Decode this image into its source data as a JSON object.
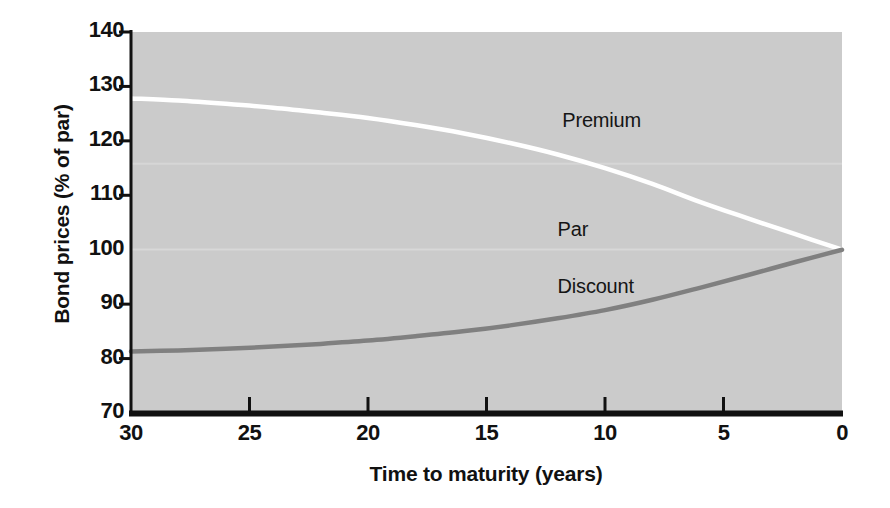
{
  "chart_data": {
    "type": "line",
    "title": "",
    "subtitle": "",
    "xlabel": "Time to maturity (years)",
    "ylabel": "Bond prices (% of par)",
    "xlim": [
      30,
      0
    ],
    "ylim": [
      70,
      140
    ],
    "x_ticks": [
      30,
      25,
      20,
      15,
      10,
      5,
      0
    ],
    "x_tick_labels": [
      "30",
      "25",
      "20",
      "15",
      "10",
      "5",
      "0"
    ],
    "y_ticks": [
      70,
      80,
      90,
      100,
      110,
      120,
      130,
      140
    ],
    "y_tick_labels": [
      "70",
      "80",
      "90",
      "100",
      "110",
      "120",
      "130",
      "140"
    ],
    "x_axis_reversed": true,
    "grid": false,
    "legend_position": "inline-annotations",
    "plot_background": "#cbcbcb",
    "figure_background": "#ffffff",
    "x": [
      30,
      28,
      26,
      24,
      22,
      20,
      18,
      16,
      14,
      12,
      10,
      8,
      6,
      4,
      2,
      0
    ],
    "series": [
      {
        "name": "Premium",
        "color": "#ffffff",
        "label": "Premium",
        "label_x": 11.8,
        "label_y": 123.5,
        "values": [
          127.8,
          127.4,
          126.8,
          126.1,
          125.2,
          124.2,
          122.9,
          121.4,
          119.6,
          117.5,
          115.0,
          112.1,
          108.8,
          105.8,
          102.9,
          100.0
        ]
      },
      {
        "name": "Discount",
        "color": "#808080",
        "label": "Discount",
        "label_x": 12.0,
        "label_y": 93.0,
        "values": [
          81.3,
          81.5,
          81.8,
          82.2,
          82.7,
          83.3,
          84.1,
          85.0,
          86.1,
          87.4,
          88.9,
          90.8,
          93.0,
          95.3,
          97.7,
          100.0
        ]
      }
    ],
    "annotations": [
      {
        "text": "Par",
        "x": 12.0,
        "y": 103.5,
        "color": "#151515"
      }
    ]
  },
  "annotations": {
    "premium": "Premium",
    "par": "Par",
    "discount": "Discount"
  },
  "axes": {
    "x_title": "Time to maturity (years)",
    "y_title": "Bond prices (% of par)"
  }
}
